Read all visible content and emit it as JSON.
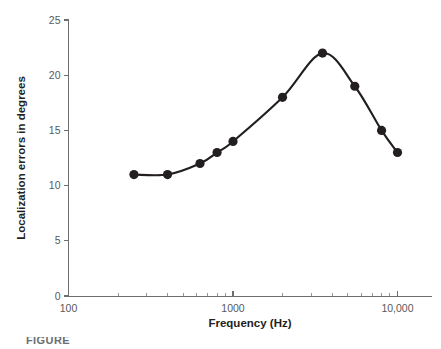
{
  "chart_data": {
    "type": "line",
    "title": "",
    "xlabel": "Frequency (Hz)",
    "ylabel": "Localization errors in degrees",
    "xscale": "log",
    "yscale": "linear",
    "xlim": [
      100,
      12000
    ],
    "ylim": [
      0,
      25
    ],
    "grid": false,
    "legend": null,
    "x_tick_labels": [
      "100",
      "1000",
      "10,000"
    ],
    "x_tick_values": [
      100,
      1000,
      10000
    ],
    "y_tick_labels": [
      "0",
      "5",
      "10",
      "15",
      "20",
      "25"
    ],
    "y_tick_values": [
      0,
      5,
      10,
      15,
      20,
      25
    ],
    "marker": "filled-circle",
    "marker_color": "#231f20",
    "line_color": "#231f20",
    "x": [
      250,
      400,
      630,
      800,
      1000,
      2000,
      3500,
      5500,
      8000,
      10000
    ],
    "values": [
      11,
      11,
      12,
      13,
      14,
      18,
      22,
      19,
      15,
      13
    ],
    "points": [
      {
        "x": 250,
        "y": 11
      },
      {
        "x": 400,
        "y": 11
      },
      {
        "x": 630,
        "y": 12
      },
      {
        "x": 800,
        "y": 13
      },
      {
        "x": 1000,
        "y": 14
      },
      {
        "x": 2000,
        "y": 18
      },
      {
        "x": 3500,
        "y": 22
      },
      {
        "x": 5500,
        "y": 19
      },
      {
        "x": 8000,
        "y": 15
      },
      {
        "x": 10000,
        "y": 13
      }
    ]
  },
  "caption": {
    "text": "FIGURE"
  }
}
